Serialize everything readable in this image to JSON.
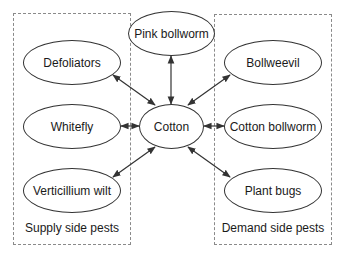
{
  "diagram": {
    "center_node": {
      "label": "Cotton"
    },
    "top_node": {
      "label": "Pink bollworm"
    },
    "supply_side": {
      "label": "Supply side pests",
      "nodes": [
        {
          "label": "Defoliators"
        },
        {
          "label": "Whitefly"
        },
        {
          "label": "Verticillium wilt"
        }
      ]
    },
    "demand_side": {
      "label": "Demand side pests",
      "nodes": [
        {
          "label": "Bollweevil"
        },
        {
          "label": "Cotton bollworm"
        },
        {
          "label": "Plant bugs"
        }
      ]
    },
    "edges": [
      {
        "from": "Cotton",
        "to": "Pink bollworm",
        "type": "bidirectional"
      },
      {
        "from": "Cotton",
        "to": "Defoliators",
        "type": "bidirectional"
      },
      {
        "from": "Cotton",
        "to": "Whitefly",
        "type": "bidirectional"
      },
      {
        "from": "Cotton",
        "to": "Verticillium wilt",
        "type": "bidirectional"
      },
      {
        "from": "Cotton",
        "to": "Bollweevil",
        "type": "bidirectional"
      },
      {
        "from": "Cotton",
        "to": "Cotton bollworm",
        "type": "bidirectional"
      },
      {
        "from": "Cotton",
        "to": "Plant bugs",
        "type": "bidirectional"
      }
    ],
    "colors": {
      "stroke": "#333333",
      "dashed_border": "#8a8a8a",
      "background": "#ffffff"
    }
  }
}
